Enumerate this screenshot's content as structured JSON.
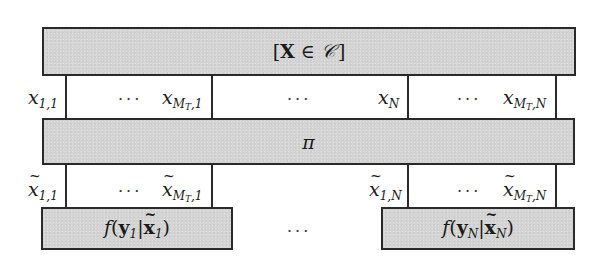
{
  "diagram": {
    "top_box": {
      "open_bracket": "[",
      "bold_var": "X",
      "element_of": " ∈ ",
      "set": "𝒞",
      "close_bracket": "]"
    },
    "middle_box": {
      "label": "π"
    },
    "bottom_boxes": [
      {
        "func": "f",
        "open": "(",
        "y_bold": "y",
        "y_sub": "1",
        "bar": "|",
        "x_bold": "x",
        "x_sub": "1",
        "close": ")"
      },
      {
        "func": "f",
        "open": "(",
        "y_bold": "y",
        "y_sub": "N",
        "bar": "|",
        "x_bold": "x",
        "x_sub": "N",
        "close": ")"
      }
    ],
    "between_bottom_boxes": "···",
    "input_row": {
      "labels": [
        {
          "var": "x",
          "sub": "1,1"
        },
        {
          "var": "x",
          "sub_main": "M",
          "sub_sub": "T",
          "sub_tail": ",1"
        },
        {
          "var": "x",
          "sub": "N"
        },
        {
          "var": "x",
          "sub_main": "M",
          "sub_sub": "T",
          "sub_tail": ",N"
        }
      ],
      "dots": [
        "···",
        "···",
        "···"
      ]
    },
    "output_row": {
      "labels": [
        {
          "var": "x",
          "sub": "1,1"
        },
        {
          "var": "x",
          "sub_main": "M",
          "sub_sub": "T",
          "sub_tail": ",1"
        },
        {
          "var": "x",
          "sub": "1,N"
        },
        {
          "var": "x",
          "sub_main": "M",
          "sub_sub": "T",
          "sub_tail": ",N"
        }
      ],
      "dots": [
        "···",
        "···"
      ]
    },
    "colors": {
      "box_fill": "#d4d4d4",
      "stroke": "#2a2a2a",
      "background": "#ffffff"
    }
  }
}
